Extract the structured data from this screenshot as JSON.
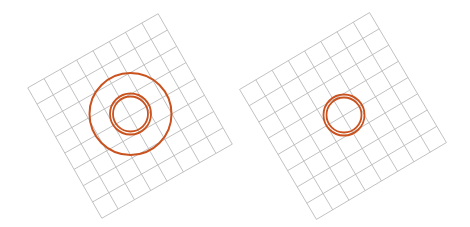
{
  "canvas": {
    "width": 470,
    "height": 227,
    "background": "#ffffff"
  },
  "colors": {
    "grid": "#b9b9b9",
    "ring": "#c9521f"
  },
  "panels": [
    {
      "name": "left-panel",
      "grid": {
        "cx": 130,
        "cy": 116,
        "size": 150,
        "cells": 8,
        "rotation": -29.6
      },
      "circles": [
        {
          "name": "outer-circle",
          "cx": 130.5,
          "cy": 114,
          "r": 41,
          "stroke": 2
        },
        {
          "name": "double-ring-outer",
          "cx": 130.5,
          "cy": 114,
          "r": 20.5,
          "stroke": 1.8
        },
        {
          "name": "double-ring-inner",
          "cx": 130.5,
          "cy": 114,
          "r": 17.5,
          "stroke": 1.8
        }
      ]
    },
    {
      "name": "right-panel",
      "grid": {
        "cx": 343,
        "cy": 116,
        "size": 151,
        "cells": 8,
        "rotation": -30.6
      },
      "circles": [
        {
          "name": "double-ring-outer",
          "cx": 344,
          "cy": 115,
          "r": 20.5,
          "stroke": 1.8
        },
        {
          "name": "double-ring-inner",
          "cx": 344,
          "cy": 115,
          "r": 17.5,
          "stroke": 1.8
        }
      ]
    }
  ]
}
